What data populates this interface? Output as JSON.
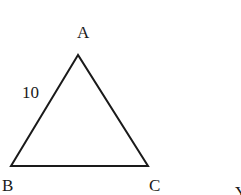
{
  "diagram": {
    "type": "triangle",
    "vertices": {
      "A": {
        "label": "A",
        "x": 78,
        "y": 55
      },
      "B": {
        "label": "B",
        "x": 11,
        "y": 166
      },
      "C": {
        "label": "C",
        "x": 148,
        "y": 166
      }
    },
    "side_labels": {
      "AB": "10"
    },
    "partial_label": "Y",
    "stroke_color": "#1a1a1a"
  }
}
